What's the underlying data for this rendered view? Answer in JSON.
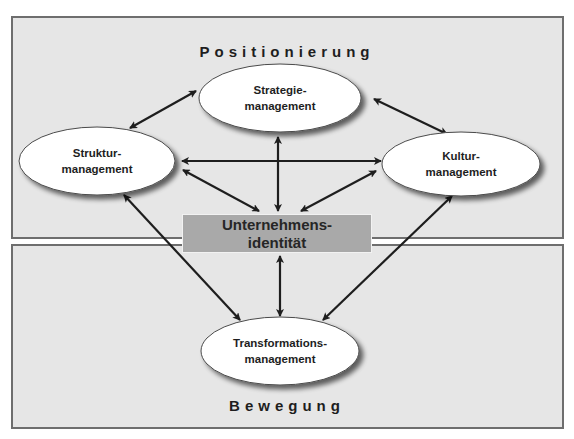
{
  "sections": {
    "top": "Positionierung",
    "bottom": "Bewegung"
  },
  "nodes": {
    "strategie": {
      "line1": "Strategie-",
      "line2": "management"
    },
    "struktur": {
      "line1": "Struktur-",
      "line2": "management"
    },
    "kultur": {
      "line1": "Kultur-",
      "line2": "management"
    },
    "transformation": {
      "line1": "Transformations-",
      "line2": "management"
    }
  },
  "center": {
    "line1": "Unternehmens-",
    "line2": "identität"
  },
  "connections": [
    {
      "from": "struktur",
      "to": "strategie",
      "type": "bidirectional"
    },
    {
      "from": "strategie",
      "to": "kultur",
      "type": "bidirectional"
    },
    {
      "from": "struktur",
      "to": "kultur",
      "type": "bidirectional"
    },
    {
      "from": "strategie",
      "to": "center",
      "type": "bidirectional"
    },
    {
      "from": "struktur",
      "to": "center",
      "type": "bidirectional"
    },
    {
      "from": "kultur",
      "to": "center",
      "type": "bidirectional"
    },
    {
      "from": "center",
      "to": "transformation",
      "type": "bidirectional"
    },
    {
      "from": "struktur",
      "to": "transformation",
      "type": "bidirectional"
    },
    {
      "from": "kultur",
      "to": "transformation",
      "type": "bidirectional"
    }
  ],
  "colors": {
    "panel_bg": "#e6e6e6",
    "panel_border": "#6e6e6e",
    "ellipse_fill": "#ffffff",
    "center_box_fill": "#a9a9a9",
    "arrow": "#1e1e1e"
  }
}
